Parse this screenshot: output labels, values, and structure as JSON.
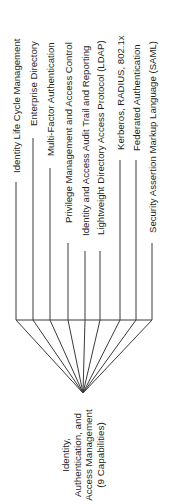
{
  "root": {
    "lines": [
      "Identity,",
      "Authentication, and",
      "Access Management",
      "(9 Capabilities)"
    ]
  },
  "capabilities": [
    {
      "label": "Identity Life Cycle Management"
    },
    {
      "label": "Enterprise Directory"
    },
    {
      "label": "Multi-Factor Authentication"
    },
    {
      "label": "Privilege Management and Access Control"
    },
    {
      "label": "Identity and Access Audit Trail and Reporting"
    },
    {
      "label": "Lightweight Directory Access Protocol (LDAP)"
    },
    {
      "label": "Kerberos, RADIUS, 802.1x"
    },
    {
      "label": "Federated Authentication"
    },
    {
      "label": "Security Assertion Markup Language (SAML)"
    }
  ],
  "colors": {
    "line": "#3a3a3a",
    "text": "#1e1e1e",
    "background": "#ffffff"
  }
}
